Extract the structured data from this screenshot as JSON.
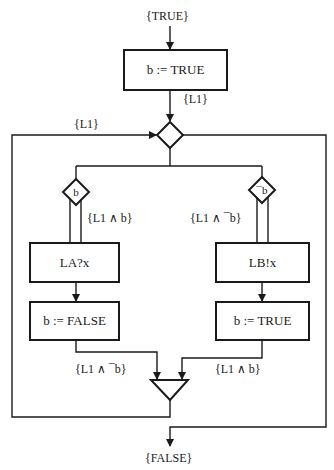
{
  "diagram": {
    "type": "flowchart",
    "start_label": "{TRUE}",
    "end_label": "{FALSE}",
    "init_box": {
      "text": "b := TRUE"
    },
    "after_init_assertion": "{L1}",
    "loop_assertion": "{L1}",
    "loop_decision": {
      "shape": "diamond",
      "text": ""
    },
    "branches": [
      {
        "guard": "b",
        "assertion": "{L1 ∧ b}",
        "action_box": "LA?x",
        "assign_box": "b := FALSE",
        "post_assertion": "{L1 ∧ ¯b}"
      },
      {
        "guard": "¯b",
        "assertion": "{L1 ∧ ¯b}",
        "action_box": "LB!x",
        "assign_box": "b := TRUE",
        "post_assertion": "{L1 ∧ b}"
      }
    ],
    "merge_node": {
      "shape": "inverted-triangle"
    },
    "colors": {
      "stroke": "#1a1a1a",
      "background": "#ffffff"
    }
  }
}
